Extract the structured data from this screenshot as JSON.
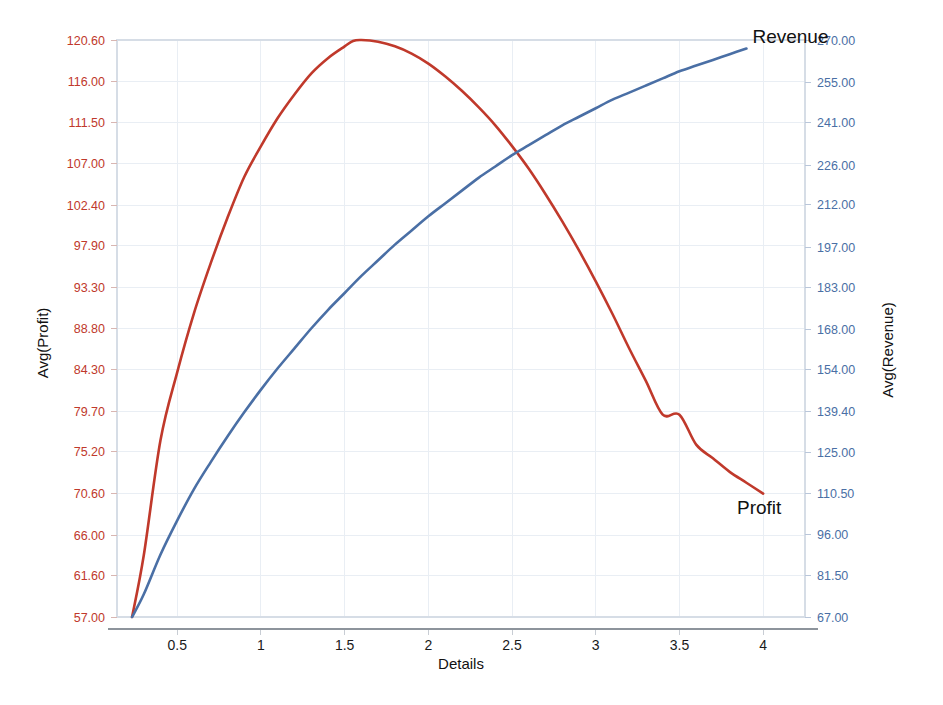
{
  "chart_data": {
    "type": "line",
    "title": "",
    "xlabel": "Details",
    "ylabel": "Avg(Profit)",
    "y2label": "Avg(Revenue)",
    "grid": true,
    "legend_position": "inline-end-labels",
    "xlim": [
      0.14,
      4.25
    ],
    "xticks": [
      "0.5",
      "1",
      "1.5",
      "2",
      "2.5",
      "3",
      "3.5",
      "4"
    ],
    "xtick_values": [
      0.5,
      1,
      1.5,
      2,
      2.5,
      3,
      3.5,
      4
    ],
    "ylim": [
      57.0,
      120.6
    ],
    "yticks": [
      "57.00",
      "61.60",
      "66.00",
      "70.60",
      "75.20",
      "79.70",
      "84.30",
      "88.80",
      "93.30",
      "97.90",
      "102.40",
      "107.00",
      "111.50",
      "116.00",
      "120.60"
    ],
    "ytick_values": [
      57.0,
      61.6,
      66.0,
      70.6,
      75.2,
      79.7,
      84.3,
      88.8,
      93.3,
      97.9,
      102.4,
      107.0,
      111.5,
      116.0,
      120.6
    ],
    "y2lim": [
      67.0,
      270.0
    ],
    "y2ticks": [
      "67.00",
      "81.50",
      "96.00",
      "110.50",
      "125.00",
      "139.40",
      "154.00",
      "168.00",
      "183.00",
      "197.00",
      "212.00",
      "226.00",
      "241.00",
      "255.00",
      "270.00"
    ],
    "y2tick_values": [
      67.0,
      81.5,
      96.0,
      110.5,
      125.0,
      139.4,
      154.0,
      168.0,
      183.0,
      197.0,
      212.0,
      226.0,
      241.0,
      255.0,
      270.0
    ],
    "series": [
      {
        "name": "Profit",
        "axis": "left",
        "color": "#c0392b",
        "label_x": 4.02,
        "label_y": 70.6,
        "x": [
          0.23,
          0.3,
          0.4,
          0.5,
          0.6,
          0.7,
          0.8,
          0.9,
          1.0,
          1.1,
          1.2,
          1.3,
          1.4,
          1.5,
          1.55,
          1.6,
          1.7,
          1.8,
          1.9,
          2.0,
          2.1,
          2.2,
          2.3,
          2.4,
          2.5,
          2.6,
          2.7,
          2.8,
          2.9,
          3.0,
          3.1,
          3.2,
          3.3,
          3.4,
          3.5,
          3.6,
          3.7,
          3.8,
          3.9,
          4.0
        ],
        "y": [
          57.0,
          63.8,
          76.5,
          84.0,
          90.5,
          96.0,
          101.0,
          105.5,
          108.9,
          112.0,
          114.6,
          116.9,
          118.6,
          119.9,
          120.5,
          120.6,
          120.4,
          119.9,
          119.1,
          118.0,
          116.6,
          115.0,
          113.2,
          111.2,
          108.9,
          106.4,
          103.6,
          100.6,
          97.4,
          94.0,
          90.4,
          86.6,
          83.0,
          79.3,
          79.3,
          76.0,
          74.5,
          73.0,
          71.8,
          70.6
        ]
      },
      {
        "name": "Revenue",
        "axis": "right",
        "color": "#4a6fa5",
        "label_x": 3.95,
        "label_y": 267.0,
        "x": [
          0.23,
          0.3,
          0.4,
          0.5,
          0.6,
          0.7,
          0.8,
          0.9,
          1.0,
          1.1,
          1.2,
          1.3,
          1.4,
          1.5,
          1.6,
          1.7,
          1.8,
          1.9,
          2.0,
          2.1,
          2.2,
          2.3,
          2.4,
          2.5,
          2.6,
          2.7,
          2.8,
          2.9,
          3.0,
          3.1,
          3.2,
          3.3,
          3.4,
          3.5,
          3.6,
          3.7,
          3.8,
          3.9
        ],
        "y": [
          67.0,
          75.0,
          89.0,
          101.0,
          112.0,
          121.5,
          130.5,
          139.0,
          147.0,
          154.5,
          161.5,
          168.5,
          175.0,
          181.0,
          187.0,
          192.5,
          198.0,
          203.0,
          208.0,
          212.5,
          217.0,
          221.5,
          225.5,
          229.5,
          233.0,
          236.5,
          240.0,
          243.0,
          246.0,
          249.0,
          251.5,
          254.0,
          256.5,
          259.0,
          261.0,
          263.0,
          265.0,
          267.0
        ]
      }
    ]
  },
  "axes": {
    "left_title": "Avg(Profit)",
    "right_title": "Avg(Revenue)",
    "x_title": "Details"
  },
  "labels": {
    "revenue": "Revenue",
    "profit": "Profit"
  },
  "colors": {
    "profit": "#c0392b",
    "revenue": "#4a6fa5",
    "grid": "#e9eef4",
    "frame": "#d6dde6",
    "text": "#111111"
  }
}
